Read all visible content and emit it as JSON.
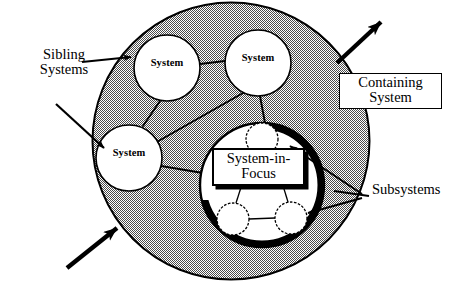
{
  "diagram": {
    "type": "nested-systems-context",
    "colors": {
      "background": "#ffffff",
      "stroke": "#000000",
      "containing_system_fill": "#9a9a9a",
      "system_node_fill": "#ffffff",
      "system_in_focus_fill": "#ffffff",
      "shadow": "#000000"
    },
    "annotations": {
      "sibling_systems": {
        "label": "Sibling\nSystems",
        "style": "plain-text",
        "arrow_count": 2,
        "points_to": [
          "system-top-left",
          "system-left"
        ]
      },
      "containing_system": {
        "label": "Containing\nSystem",
        "style": "boxed",
        "arrow_count": 1,
        "points_to": [
          "containing-system-boundary"
        ]
      },
      "system_in_focus": {
        "label": "System-in-\nFocus",
        "style": "boxed-with-shadow",
        "points_to": [
          "system-in-focus-circle"
        ]
      },
      "subsystems": {
        "label": "Subsystems",
        "style": "plain-text",
        "arrow_count": 2,
        "points_to": [
          "subsystem-top",
          "subsystem-bottom-right"
        ]
      }
    },
    "nodes": [
      {
        "id": "system-top-left",
        "label": "System",
        "shape": "circle",
        "fill": "white",
        "cx": 167,
        "cy": 68,
        "r": 33
      },
      {
        "id": "system-top-right",
        "label": "System",
        "shape": "circle",
        "fill": "white",
        "cx": 258,
        "cy": 63,
        "r": 33
      },
      {
        "id": "system-left",
        "label": "System",
        "shape": "circle",
        "fill": "white",
        "cx": 129,
        "cy": 158,
        "r": 33
      },
      {
        "id": "system-in-focus",
        "label": "System-in-Focus",
        "shape": "circle",
        "fill": "white",
        "cx": 262,
        "cy": 185,
        "r": 62
      },
      {
        "id": "subsystem-top",
        "label": "",
        "shape": "circle",
        "fill": "white",
        "cx": 262,
        "cy": 139,
        "r": 16
      },
      {
        "id": "subsystem-bottom-left",
        "label": "",
        "shape": "circle",
        "fill": "white",
        "cx": 233,
        "cy": 219,
        "r": 16
      },
      {
        "id": "subsystem-bottom-right",
        "label": "",
        "shape": "circle",
        "fill": "white",
        "cx": 291,
        "cy": 218,
        "r": 16
      }
    ],
    "edges": [
      {
        "from": "system-top-left",
        "to": "system-top-right"
      },
      {
        "from": "system-top-left",
        "to": "system-left"
      },
      {
        "from": "system-top-right",
        "to": "system-in-focus"
      },
      {
        "from": "system-top-right",
        "to": "system-left"
      },
      {
        "from": "system-left",
        "to": "system-in-focus"
      },
      {
        "from": "subsystem-top",
        "to": "subsystem-bottom-left",
        "style": "dashed"
      },
      {
        "from": "subsystem-top",
        "to": "subsystem-bottom-right",
        "style": "dashed"
      },
      {
        "from": "subsystem-bottom-left",
        "to": "subsystem-bottom-right",
        "style": "dashed"
      }
    ],
    "boundary": {
      "id": "containing-system-boundary",
      "shape": "ellipse",
      "cx": 231,
      "cy": 141,
      "rx": 139,
      "ry": 139,
      "fill": "halftone-gray"
    }
  }
}
